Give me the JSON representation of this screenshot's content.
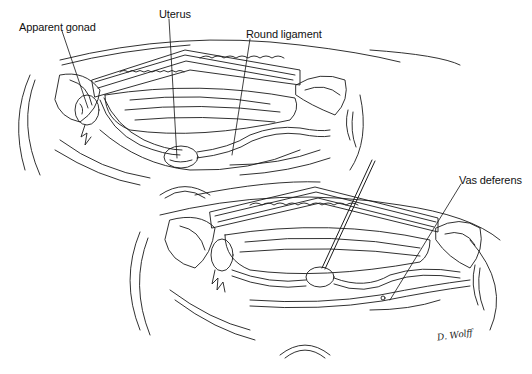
{
  "figure": {
    "type": "surgical-illustration",
    "panels": [
      {
        "id": "top",
        "labels": [
          {
            "text": "Apparent gonad",
            "x": 19,
            "y": 24
          },
          {
            "text": "Uterus",
            "x": 162,
            "y": 11
          },
          {
            "text": "Round ligament",
            "x": 246,
            "y": 31
          }
        ]
      },
      {
        "id": "bottom",
        "labels": [
          {
            "text": "Vas deferens",
            "x": 459,
            "y": 177
          }
        ]
      }
    ],
    "signature": "D. Wolff",
    "colors": {
      "ink": "#111111",
      "background": "#ffffff"
    }
  }
}
